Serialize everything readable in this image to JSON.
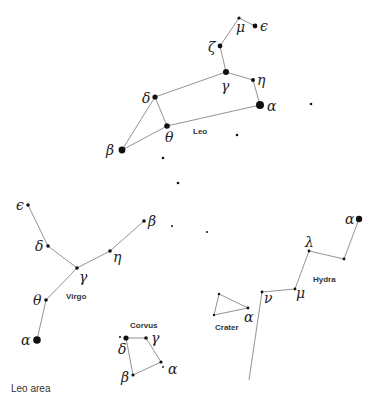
{
  "caption": "Leo area",
  "colors": {
    "line": "#777777",
    "star": "#111111",
    "text": "#222222"
  },
  "constellations": [
    {
      "name": "Leo",
      "label_pos": [
        193,
        134
      ],
      "stars": [
        {
          "id": "mu",
          "symbol": "μ",
          "x": 239,
          "y": 18,
          "r": 1.6,
          "lx": 236,
          "ly": 32
        },
        {
          "id": "epsilon",
          "symbol": "ϵ",
          "x": 255,
          "y": 26,
          "r": 2.4,
          "lx": 260,
          "ly": 31
        },
        {
          "id": "zeta",
          "symbol": "ζ",
          "x": 220,
          "y": 46,
          "r": 2.4,
          "lx": 208,
          "ly": 52
        },
        {
          "id": "gamma",
          "symbol": "γ",
          "x": 226,
          "y": 72,
          "r": 3.0,
          "lx": 221,
          "ly": 91
        },
        {
          "id": "eta",
          "symbol": "η",
          "x": 253,
          "y": 80,
          "r": 2.0,
          "lx": 257,
          "ly": 85
        },
        {
          "id": "alpha",
          "symbol": "α",
          "x": 260,
          "y": 105,
          "r": 4.0,
          "lx": 267,
          "ly": 111
        },
        {
          "id": "delta",
          "symbol": "δ",
          "x": 155,
          "y": 97,
          "r": 2.6,
          "lx": 142,
          "ly": 103
        },
        {
          "id": "theta",
          "symbol": "θ",
          "x": 167,
          "y": 126,
          "r": 2.8,
          "lx": 165,
          "ly": 142
        },
        {
          "id": "beta",
          "symbol": "β",
          "x": 122,
          "y": 150,
          "r": 3.4,
          "lx": 106,
          "ly": 155
        }
      ],
      "lines": [
        [
          "mu",
          "epsilon"
        ],
        [
          "mu",
          "zeta"
        ],
        [
          "zeta",
          "gamma"
        ],
        [
          "gamma",
          "eta"
        ],
        [
          "eta",
          "alpha"
        ],
        [
          "gamma",
          "delta"
        ],
        [
          "alpha",
          "theta"
        ],
        [
          "delta",
          "theta"
        ],
        [
          "delta",
          "beta"
        ],
        [
          "theta",
          "beta"
        ]
      ]
    },
    {
      "name": "Virgo",
      "label_pos": [
        66,
        299
      ],
      "stars": [
        {
          "id": "epsilon",
          "symbol": "ϵ",
          "x": 28,
          "y": 205,
          "r": 1.8,
          "lx": 16,
          "ly": 210
        },
        {
          "id": "delta",
          "symbol": "δ",
          "x": 48,
          "y": 246,
          "r": 1.8,
          "lx": 35,
          "ly": 251
        },
        {
          "id": "gamma",
          "symbol": "γ",
          "x": 77,
          "y": 268,
          "r": 1.8,
          "lx": 79,
          "ly": 282
        },
        {
          "id": "eta",
          "symbol": "η",
          "x": 110,
          "y": 251,
          "r": 1.8,
          "lx": 113,
          "ly": 262
        },
        {
          "id": "beta",
          "symbol": "β",
          "x": 144,
          "y": 221,
          "r": 1.8,
          "lx": 148,
          "ly": 226
        },
        {
          "id": "theta",
          "symbol": "θ",
          "x": 46,
          "y": 300,
          "r": 1.8,
          "lx": 33,
          "ly": 305
        },
        {
          "id": "alpha",
          "symbol": "α",
          "x": 37,
          "y": 340,
          "r": 3.8,
          "lx": 21,
          "ly": 345
        }
      ],
      "lines": [
        [
          "epsilon",
          "delta"
        ],
        [
          "delta",
          "gamma"
        ],
        [
          "gamma",
          "eta"
        ],
        [
          "eta",
          "beta"
        ],
        [
          "gamma",
          "theta"
        ],
        [
          "theta",
          "alpha"
        ]
      ]
    },
    {
      "name": "Corvus",
      "label_pos": [
        130,
        328
      ],
      "stars": [
        {
          "id": "delta",
          "symbol": "δ",
          "x": 126,
          "y": 338,
          "r": 2.6,
          "lx": 118,
          "ly": 354
        },
        {
          "id": "gamma",
          "symbol": "γ",
          "x": 146,
          "y": 338,
          "r": 1.8,
          "lx": 151,
          "ly": 343
        },
        {
          "id": "alpha",
          "symbol": "α",
          "x": 161,
          "y": 362,
          "r": 1.6,
          "lx": 168,
          "ly": 374
        },
        {
          "id": "beta",
          "symbol": "β",
          "x": 133,
          "y": 375,
          "r": 1.6,
          "lx": 121,
          "ly": 382
        }
      ],
      "lines": [
        [
          "delta",
          "gamma"
        ],
        [
          "gamma",
          "alpha"
        ],
        [
          "alpha",
          "beta"
        ],
        [
          "beta",
          "delta"
        ]
      ]
    },
    {
      "name": "Crater",
      "label_pos": [
        215,
        330
      ],
      "stars": [
        {
          "id": "a1",
          "symbol": "",
          "x": 219,
          "y": 294,
          "r": 1.2
        },
        {
          "id": "a2",
          "symbol": "",
          "x": 214,
          "y": 315,
          "r": 1.2
        },
        {
          "id": "alpha",
          "symbol": "α",
          "x": 248,
          "y": 308,
          "r": 1.4,
          "lx": 244,
          "ly": 322
        }
      ],
      "lines": [
        [
          "a1",
          "a2"
        ],
        [
          "a2",
          "alpha"
        ],
        [
          "alpha",
          "a1"
        ]
      ]
    },
    {
      "name": "Hydra",
      "label_pos": [
        313,
        282
      ],
      "stars": [
        {
          "id": "alpha",
          "symbol": "α",
          "x": 359,
          "y": 219,
          "r": 3.2,
          "lx": 345,
          "ly": 224
        },
        {
          "id": "h1",
          "symbol": "",
          "x": 344,
          "y": 259,
          "r": 1.4
        },
        {
          "id": "lambda",
          "symbol": "λ",
          "x": 309,
          "y": 251,
          "r": 1.4,
          "lx": 305,
          "ly": 247
        },
        {
          "id": "mu",
          "symbol": "μ",
          "x": 295,
          "y": 289,
          "r": 1.4,
          "lx": 296,
          "ly": 298
        },
        {
          "id": "nu",
          "symbol": "ν",
          "x": 262,
          "y": 292,
          "r": 1.4,
          "lx": 264,
          "ly": 303
        },
        {
          "id": "tail",
          "symbol": "",
          "x": 249,
          "y": 380,
          "r": 0
        }
      ],
      "lines": [
        [
          "alpha",
          "h1"
        ],
        [
          "h1",
          "lambda"
        ],
        [
          "lambda",
          "mu"
        ],
        [
          "mu",
          "nu"
        ],
        [
          "nu",
          "tail"
        ]
      ]
    }
  ],
  "field_stars": [
    {
      "x": 311,
      "y": 104,
      "r": 1.3
    },
    {
      "x": 237,
      "y": 135,
      "r": 1.3
    },
    {
      "x": 163,
      "y": 158,
      "r": 1.3
    },
    {
      "x": 178,
      "y": 183,
      "r": 1.3
    },
    {
      "x": 172,
      "y": 226,
      "r": 1.0
    },
    {
      "x": 207,
      "y": 232,
      "r": 1.0
    },
    {
      "x": 120,
      "y": 337,
      "r": 1.0
    },
    {
      "x": 163,
      "y": 367,
      "r": 0.9
    }
  ]
}
